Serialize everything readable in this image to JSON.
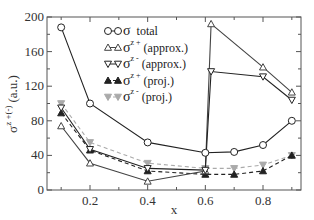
{
  "chart_data": {
    "type": "line",
    "title": "",
    "xlabel": "x",
    "ylabel": "σ^{z+(-)} (a.u.)",
    "ylabel_main": "σ",
    "ylabel_sup": "z +(-)",
    "ylabel_unit": "(a.u.)",
    "xlim": [
      0.05,
      0.93
    ],
    "ylim": [
      0,
      200
    ],
    "x_ticks": [
      0.2,
      0.4,
      0.6,
      0.8
    ],
    "x_tick_labels": [
      "0.2",
      "0.4",
      "0.6",
      "0.8"
    ],
    "y_ticks": [
      0,
      40,
      80,
      120,
      160,
      200
    ],
    "y_tick_labels": [
      "0",
      "40",
      "80",
      "120",
      "160",
      "200"
    ],
    "grid": false,
    "legend_position": "upper center",
    "series": [
      {
        "name": "σ total",
        "legend_main": "σ",
        "legend_sup": "",
        "legend_suffix": "total",
        "marker": "circle-open",
        "line": "solid",
        "color": "#222222",
        "x": [
          0.1,
          0.2,
          0.4,
          0.6,
          0.7,
          0.8,
          0.9
        ],
        "y": [
          188,
          100,
          55,
          43,
          44,
          52,
          80
        ]
      },
      {
        "name": "σ^{z+} (approx.)",
        "legend_main": "σ",
        "legend_sup": "z +",
        "legend_suffix": "(approx.)",
        "marker": "triangle-up-open",
        "line": "solid",
        "color": "#444444",
        "x": [
          0.1,
          0.2,
          0.4,
          0.6,
          0.62,
          0.8,
          0.9
        ],
        "y": [
          74,
          31,
          10,
          22,
          192,
          142,
          113
        ]
      },
      {
        "name": "σ^{z-} (approx.)",
        "legend_main": "σ",
        "legend_sup": "z -",
        "legend_suffix": "(approx.)",
        "marker": "triangle-down-open",
        "line": "solid",
        "color": "#222222",
        "x": [
          0.1,
          0.2,
          0.4,
          0.6,
          0.62,
          0.8,
          0.9
        ],
        "y": [
          95,
          47,
          25,
          23,
          137,
          131,
          104
        ]
      },
      {
        "name": "σ^{z+} (proj.)",
        "legend_main": "σ",
        "legend_sup": "z +",
        "legend_suffix": "(proj.)",
        "marker": "triangle-up-filled",
        "line": "dashed",
        "color": "#222222",
        "x": [
          0.1,
          0.2,
          0.4,
          0.6,
          0.7,
          0.8,
          0.9
        ],
        "y": [
          89,
          46,
          22,
          18,
          18,
          22,
          40
        ]
      },
      {
        "name": "σ^{z-} (proj.)",
        "legend_main": "σ",
        "legend_sup": "z -",
        "legend_suffix": "(proj.)",
        "marker": "triangle-down-filled",
        "line": "dashed",
        "color": "#aaaaaa",
        "x": [
          0.1,
          0.2,
          0.4,
          0.6,
          0.7,
          0.8,
          0.9
        ],
        "y": [
          100,
          55,
          31,
          25,
          25,
          29,
          40
        ]
      }
    ]
  }
}
